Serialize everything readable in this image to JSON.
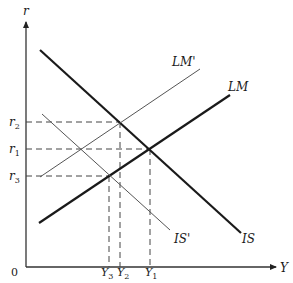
{
  "diagram": {
    "type": "IS-LM diagram",
    "axes": {
      "y_label": "r",
      "x_label": "Y",
      "origin_label": "0"
    },
    "curves": [
      {
        "id": "IS",
        "label": "IS",
        "weight": "thick"
      },
      {
        "id": "LM",
        "label": "LM",
        "weight": "thick"
      },
      {
        "id": "IS_prime",
        "label": "IS'",
        "weight": "thin"
      },
      {
        "id": "LM_prime",
        "label": "LM'",
        "weight": "thin"
      }
    ],
    "y_ticks": [
      {
        "label": "r",
        "sub": "2"
      },
      {
        "label": "r",
        "sub": "1"
      },
      {
        "label": "r",
        "sub": "3"
      }
    ],
    "x_ticks": [
      {
        "label": "Y",
        "sub": "3"
      },
      {
        "label": "Y",
        "sub": "2"
      },
      {
        "label": "Y",
        "sub": "1"
      }
    ],
    "equilibria": [
      {
        "name": "IS ∩ LM'",
        "r": "r2",
        "Y": "Y2"
      },
      {
        "name": "IS ∩ LM",
        "r": "r1",
        "Y": "Y1"
      },
      {
        "name": "IS' ∩ LM",
        "r": "r3",
        "Y": "Y3"
      }
    ]
  }
}
